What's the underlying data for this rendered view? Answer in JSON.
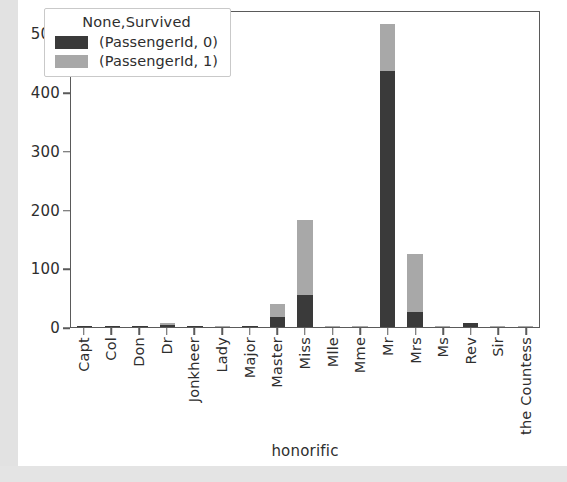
{
  "chart_data": {
    "type": "bar",
    "subtype": "stacked",
    "title": "",
    "xlabel": "honorific",
    "ylabel": "",
    "ylim": [
      0,
      540
    ],
    "yticks": [
      0,
      100,
      200,
      300,
      400,
      500
    ],
    "ytick_labels": [
      "0",
      "100",
      "200",
      "300",
      "400",
      "500"
    ],
    "grid": false,
    "legend": {
      "title": "None,Survived",
      "position": "upper left",
      "entries": [
        {
          "label": "(PassengerId, 0)",
          "color": "#3a3a3a"
        },
        {
          "label": "(PassengerId, 1)",
          "color": "#a8a8a8"
        }
      ]
    },
    "categories": [
      "Capt",
      "Col",
      "Don",
      "Dr",
      "Jonkheer",
      "Lady",
      "Major",
      "Master",
      "Miss",
      "Mlle",
      "Mme",
      "Mr",
      "Mrs",
      "Ms",
      "Rev",
      "Sir",
      "the Countess"
    ],
    "series": [
      {
        "name": "(PassengerId, 0)",
        "color": "#3a3a3a",
        "values": [
          1,
          1,
          1,
          4,
          1,
          0,
          1,
          17,
          55,
          0,
          0,
          436,
          26,
          0,
          6,
          0,
          0
        ]
      },
      {
        "name": "(PassengerId, 1)",
        "color": "#a8a8a8",
        "values": [
          0,
          1,
          0,
          3,
          0,
          1,
          1,
          23,
          127,
          2,
          1,
          81,
          99,
          1,
          0,
          1,
          1
        ]
      }
    ],
    "totals": [
      1,
      2,
      1,
      7,
      1,
      1,
      2,
      40,
      182,
      2,
      1,
      517,
      125,
      1,
      6,
      1,
      1
    ]
  },
  "colors": {
    "dead": "#3a3a3a",
    "alive": "#a8a8a8",
    "axis": "#5a5a5a",
    "text": "#2e2e2e",
    "page_background": "#e9e9e9",
    "plot_background": "#ffffff"
  }
}
